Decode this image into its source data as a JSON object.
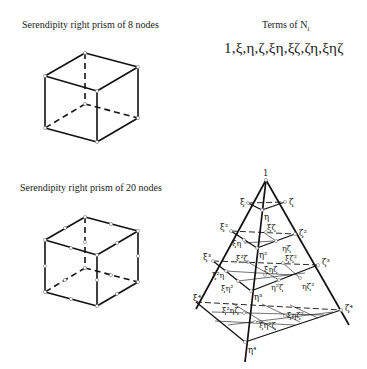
{
  "panels": {
    "prism8": {
      "caption": "Serendipity right prism of 8 nodes"
    },
    "terms": {
      "caption": "Terms of  N",
      "subscript": "i",
      "list": "1,ξ,η,ζ,ξη,ξζ,ζη,ξηζ"
    },
    "prism20": {
      "caption": "Serendipity right prism of 20 nodes"
    }
  },
  "pyramid": {
    "apex_label": "1",
    "layer1": {
      "xi": "ξ",
      "eta": "η",
      "zeta": "ζ"
    },
    "layer2": {
      "xi": "ξ²",
      "eta": "η²",
      "zeta": "ζ²",
      "inner": [
        "ξζ",
        "ξη",
        "ηζ"
      ]
    },
    "layer3": {
      "xi": "ξ³",
      "eta": "η³",
      "zeta": "ζ³",
      "inner": [
        "ξ²ζ",
        "ξζ²",
        "ξ²η",
        "ξηζ",
        "ξη²",
        "η²ζ",
        "ηζ²"
      ]
    },
    "layer4": {
      "eta": "η⁴",
      "zeta": "ζ⁴",
      "xi": "ξ⁴",
      "inner": [
        "ξ²ηζ",
        "ξη²ζ",
        "ξηζ²"
      ]
    }
  }
}
